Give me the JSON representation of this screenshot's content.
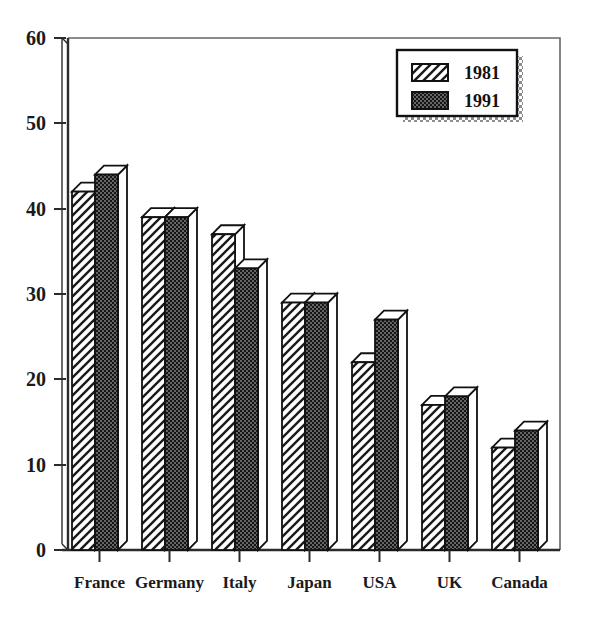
{
  "chart_data": {
    "type": "bar",
    "title": "",
    "xlabel": "",
    "ylabel": "",
    "categories": [
      "France",
      "Germany",
      "Italy",
      "Japan",
      "USA",
      "UK",
      "Canada"
    ],
    "series": [
      {
        "name": "1981",
        "values": [
          42,
          39,
          37,
          29,
          22,
          17,
          12
        ]
      },
      {
        "name": "1991",
        "values": [
          44,
          39,
          33,
          29,
          27,
          18,
          14
        ]
      }
    ],
    "ylim": [
      0,
      60
    ],
    "yticks": [
      0,
      10,
      20,
      30,
      40,
      50,
      60
    ],
    "ytick_labels": [
      "0",
      "10",
      "20",
      "30",
      "40",
      "50",
      "60"
    ],
    "grid": false,
    "legend_position": "top-right",
    "style": "3d-bars-monochrome",
    "colors": {
      "series_1981_fill": "#ffffff",
      "series_1981_pattern": "diagonal-hatch",
      "series_1991_fill": "#1a1a1a",
      "series_1991_pattern": "dark-stipple",
      "axis": "#333333",
      "frame": "#555555",
      "legend_shadow": "#9a9a9a",
      "text": "#1a1a1a"
    }
  },
  "legend": {
    "entries": [
      {
        "label": "1981",
        "swatch": "hatch-swatch"
      },
      {
        "label": "1991",
        "swatch": "solid-dark-swatch"
      }
    ]
  }
}
